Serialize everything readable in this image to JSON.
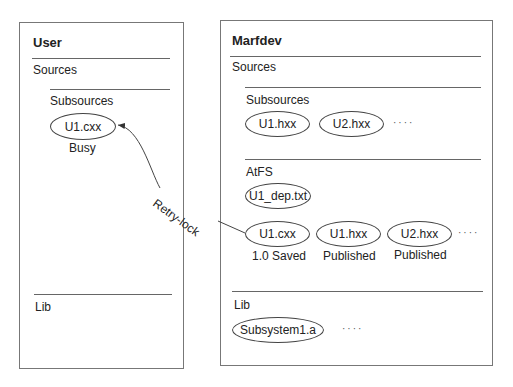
{
  "user_box": {
    "title": "User",
    "sources_label": "Sources",
    "subsources_label": "Subsources",
    "file": {
      "name": "U1.cxx",
      "status": "Busy"
    },
    "lib_label": "Lib"
  },
  "marfdev_box": {
    "title": "Marfdev",
    "sources_label": "Sources",
    "subsources": {
      "label": "Subsources",
      "files": [
        "U1.hxx",
        "U2.hxx"
      ],
      "more": "····"
    },
    "atfs": {
      "label": "AtFS",
      "dep_file": "U1_dep.txt",
      "files": [
        {
          "name": "U1.cxx",
          "status": "1.0 Saved"
        },
        {
          "name": "U1.hxx",
          "status": "Published"
        },
        {
          "name": "U2.hxx",
          "status": "Published"
        }
      ],
      "more": "····"
    },
    "lib": {
      "label": "Lib",
      "files": [
        "Subsystem1.a"
      ],
      "more": "····"
    }
  },
  "arrow": {
    "label": "Retry-lock",
    "from": "marfdev.atfs.U1.cxx",
    "to": "user.subsources.U1.cxx"
  }
}
